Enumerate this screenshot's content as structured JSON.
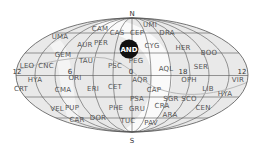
{
  "map": {
    "projection": "equal-area ellipse (Mollweide-style) sky map",
    "colors": {
      "background": "#ffffff",
      "sky_fill": "#e9e9e9",
      "milky_way": "#fafafa",
      "grid": "#555555",
      "ecliptic": "#b8b8b8",
      "label": "#555555",
      "highlight_fill": "#111111",
      "highlight_text": "#ffffff"
    },
    "poles": {
      "north": "N",
      "south": "S"
    },
    "hour_labels": [
      {
        "text": "12",
        "x": 17,
        "y": 74
      },
      {
        "text": "6",
        "x": 70,
        "y": 74
      },
      {
        "text": "0",
        "x": 131,
        "y": 74
      },
      {
        "text": "18",
        "x": 183,
        "y": 74
      },
      {
        "text": "12",
        "x": 242,
        "y": 74
      }
    ],
    "highlighted": {
      "abbr": "AND",
      "x": 129,
      "y": 49
    },
    "constellations": [
      {
        "abbr": "CAM",
        "x": 100,
        "y": 31
      },
      {
        "abbr": "UMI",
        "x": 150,
        "y": 27
      },
      {
        "abbr": "UMA",
        "x": 60,
        "y": 39
      },
      {
        "abbr": "CAS",
        "x": 117,
        "y": 35
      },
      {
        "abbr": "CEP",
        "x": 137,
        "y": 35
      },
      {
        "abbr": "DRA",
        "x": 167,
        "y": 35
      },
      {
        "abbr": "AUR",
        "x": 85,
        "y": 47
      },
      {
        "abbr": "PER",
        "x": 101,
        "y": 45
      },
      {
        "abbr": "CYG",
        "x": 152,
        "y": 48
      },
      {
        "abbr": "HER",
        "x": 183,
        "y": 50
      },
      {
        "abbr": "BOO",
        "x": 209,
        "y": 55
      },
      {
        "abbr": "GEM",
        "x": 63,
        "y": 57
      },
      {
        "abbr": "TAU",
        "x": 86,
        "y": 63
      },
      {
        "abbr": "PSC",
        "x": 115,
        "y": 68
      },
      {
        "abbr": "PEG",
        "x": 136,
        "y": 63
      },
      {
        "abbr": "LEO",
        "x": 27,
        "y": 68
      },
      {
        "abbr": "CNC",
        "x": 46,
        "y": 68
      },
      {
        "abbr": "AQL",
        "x": 166,
        "y": 71
      },
      {
        "abbr": "SER",
        "x": 201,
        "y": 69
      },
      {
        "abbr": "ORI",
        "x": 75,
        "y": 80
      },
      {
        "abbr": "HYA",
        "x": 35,
        "y": 82
      },
      {
        "abbr": "AQR",
        "x": 140,
        "y": 82
      },
      {
        "abbr": "OPH",
        "x": 189,
        "y": 82
      },
      {
        "abbr": "VIR",
        "x": 238,
        "y": 82
      },
      {
        "abbr": "CRT",
        "x": 21,
        "y": 91
      },
      {
        "abbr": "CMA",
        "x": 63,
        "y": 92
      },
      {
        "abbr": "ERI",
        "x": 93,
        "y": 91
      },
      {
        "abbr": "CET",
        "x": 115,
        "y": 89
      },
      {
        "abbr": "CAP",
        "x": 154,
        "y": 92
      },
      {
        "abbr": "LIB",
        "x": 208,
        "y": 91
      },
      {
        "abbr": "HYA",
        "x": 225,
        "y": 96
      },
      {
        "abbr": "PSA",
        "x": 137,
        "y": 101
      },
      {
        "abbr": "SGR",
        "x": 171,
        "y": 101
      },
      {
        "abbr": "SCO",
        "x": 189,
        "y": 101
      },
      {
        "abbr": "VEL",
        "x": 57,
        "y": 111
      },
      {
        "abbr": "PUP",
        "x": 72,
        "y": 110
      },
      {
        "abbr": "PHE",
        "x": 116,
        "y": 110
      },
      {
        "abbr": "GRU",
        "x": 137,
        "y": 111
      },
      {
        "abbr": "CRA",
        "x": 162,
        "y": 108
      },
      {
        "abbr": "CEN",
        "x": 203,
        "y": 110
      },
      {
        "abbr": "CAR",
        "x": 77,
        "y": 122
      },
      {
        "abbr": "DOR",
        "x": 98,
        "y": 120
      },
      {
        "abbr": "ARA",
        "x": 170,
        "y": 117
      },
      {
        "abbr": "TUC",
        "x": 128,
        "y": 123
      },
      {
        "abbr": "PAV",
        "x": 151,
        "y": 125
      }
    ]
  }
}
